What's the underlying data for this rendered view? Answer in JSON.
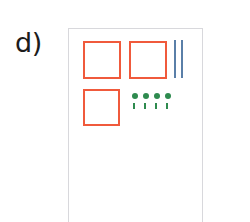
{
  "figure": {
    "panel_label": "d)",
    "background_color": "#ffffff",
    "panel": {
      "border_color": "#d8d8dc",
      "border_width": 1,
      "x": 68,
      "y": 28,
      "width": 135,
      "height": 205
    },
    "shapes": {
      "squares": {
        "name": "red-square",
        "stroke_color": "#f05a3c",
        "stroke_width": 2,
        "fill": "none",
        "count": 3,
        "items": [
          {
            "label": "square-1",
            "x": 14,
            "y": 12,
            "size": 38
          },
          {
            "label": "square-2",
            "x": 60,
            "y": 12,
            "size": 38
          },
          {
            "label": "square-3",
            "x": 14,
            "y": 60,
            "size": 37
          }
        ]
      },
      "lines": {
        "name": "blue-vertical-line",
        "stroke_color": "#5a7fa8",
        "stroke_width": 2,
        "count": 2,
        "items": [
          {
            "label": "line-1",
            "x": 105,
            "y": 11,
            "height": 38
          },
          {
            "label": "line-2",
            "x": 112,
            "y": 11,
            "height": 38
          }
        ]
      },
      "dots": {
        "name": "green-dot",
        "color": "#2e8b4f",
        "count": 4,
        "radius": 3,
        "row_y": 64,
        "items": [
          {
            "label": "dot-1",
            "x": 63
          },
          {
            "label": "dot-2",
            "x": 74
          },
          {
            "label": "dot-3",
            "x": 85
          },
          {
            "label": "dot-4",
            "x": 96
          }
        ]
      },
      "ticks": {
        "name": "green-tick",
        "color": "#2e8b4f",
        "count": 4,
        "row_y": 74,
        "width": 2,
        "height": 6,
        "items": [
          {
            "label": "tick-1",
            "x": 64
          },
          {
            "label": "tick-2",
            "x": 75
          },
          {
            "label": "tick-3",
            "x": 86
          },
          {
            "label": "tick-4",
            "x": 97
          }
        ]
      }
    }
  }
}
